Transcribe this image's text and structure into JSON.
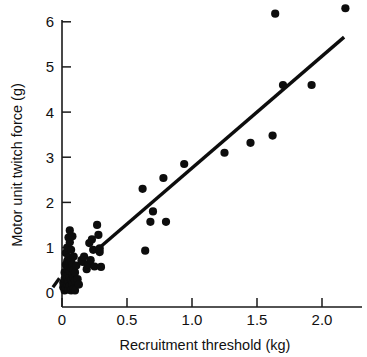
{
  "chart_data": {
    "type": "scatter",
    "title": "",
    "xlabel": "Recruitment threshold (kg)",
    "ylabel": "Motor unit twitch force (g)",
    "xlim": [
      -0.1,
      2.3
    ],
    "ylim": [
      -0.2,
      6.5
    ],
    "xticks": [
      0,
      0.5,
      1.0,
      1.5,
      2.0
    ],
    "xticklabels": [
      "0",
      "0.5",
      "1.0",
      "1.5",
      "2.0"
    ],
    "yticks": [
      0,
      1,
      2,
      3,
      4,
      5,
      6
    ],
    "yticklabels": [
      "0",
      "1",
      "2",
      "3",
      "4",
      "5",
      "6"
    ],
    "grid": false,
    "legend": null,
    "marker": "filled-circle",
    "marker_color": "#0d0d0d",
    "points": [
      [
        0.01,
        0.12
      ],
      [
        0.01,
        0.22
      ],
      [
        0.02,
        0.05
      ],
      [
        0.02,
        0.3
      ],
      [
        0.02,
        0.45
      ],
      [
        0.03,
        0.1
      ],
      [
        0.03,
        0.38
      ],
      [
        0.03,
        0.62
      ],
      [
        0.03,
        0.88
      ],
      [
        0.04,
        0.18
      ],
      [
        0.04,
        0.33
      ],
      [
        0.04,
        0.52
      ],
      [
        0.04,
        0.7
      ],
      [
        0.04,
        1.0
      ],
      [
        0.05,
        0.08
      ],
      [
        0.05,
        0.25
      ],
      [
        0.05,
        0.42
      ],
      [
        0.05,
        0.58
      ],
      [
        0.05,
        0.78
      ],
      [
        0.05,
        1.22
      ],
      [
        0.06,
        0.15
      ],
      [
        0.06,
        0.35
      ],
      [
        0.06,
        0.48
      ],
      [
        0.06,
        0.66
      ],
      [
        0.06,
        1.12
      ],
      [
        0.06,
        1.38
      ],
      [
        0.07,
        0.05
      ],
      [
        0.07,
        0.28
      ],
      [
        0.07,
        0.55
      ],
      [
        0.07,
        0.72
      ],
      [
        0.07,
        0.95
      ],
      [
        0.08,
        0.2
      ],
      [
        0.08,
        0.4
      ],
      [
        0.08,
        0.62
      ],
      [
        0.08,
        1.25
      ],
      [
        0.09,
        0.08
      ],
      [
        0.09,
        0.33
      ],
      [
        0.09,
        0.5
      ],
      [
        0.09,
        0.8
      ],
      [
        0.1,
        0.05
      ],
      [
        0.1,
        0.26
      ],
      [
        0.1,
        0.45
      ],
      [
        0.11,
        0.6
      ],
      [
        0.12,
        0.3
      ],
      [
        0.13,
        0.18
      ],
      [
        0.15,
        0.72
      ],
      [
        0.16,
        0.68
      ],
      [
        0.17,
        0.8
      ],
      [
        0.19,
        0.52
      ],
      [
        0.2,
        0.62
      ],
      [
        0.21,
        1.1
      ],
      [
        0.22,
        0.72
      ],
      [
        0.23,
        1.18
      ],
      [
        0.24,
        0.95
      ],
      [
        0.25,
        0.58
      ],
      [
        0.27,
        1.5
      ],
      [
        0.28,
        1.28
      ],
      [
        0.29,
        0.9
      ],
      [
        0.29,
        0.98
      ],
      [
        0.3,
        0.57
      ],
      [
        0.62,
        2.3
      ],
      [
        0.64,
        0.93
      ],
      [
        0.68,
        1.57
      ],
      [
        0.7,
        1.8
      ],
      [
        0.78,
        2.54
      ],
      [
        0.8,
        1.57
      ],
      [
        0.94,
        2.85
      ],
      [
        1.25,
        3.1
      ],
      [
        1.45,
        3.32
      ],
      [
        1.62,
        3.48
      ],
      [
        1.64,
        6.18
      ],
      [
        1.7,
        4.6
      ],
      [
        1.92,
        4.6
      ],
      [
        2.18,
        6.3
      ]
    ],
    "fit_line": {
      "label": "regression line",
      "x0": 0.29,
      "y0": 1.0,
      "x1": 2.17,
      "y1": 5.66
    },
    "fit_line_stub": {
      "label": "regression line lower extension",
      "x0": -0.07,
      "y0": 0.12,
      "x1": -0.02,
      "y1": 0.32
    }
  }
}
